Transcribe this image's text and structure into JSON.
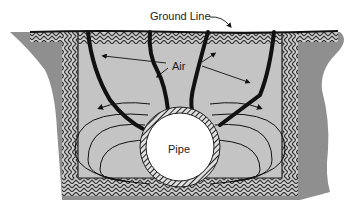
{
  "diagram": {
    "labels": {
      "ground_line": "Ground Line",
      "air": "Air",
      "pipe": "Pipe"
    },
    "colors": {
      "background": "#ffffff",
      "native_soil": "#8f8f8f",
      "backfill": "#c4c4c4",
      "hatch": "#333333",
      "crack": "#111111",
      "pipe_interior": "#ffffff"
    }
  }
}
